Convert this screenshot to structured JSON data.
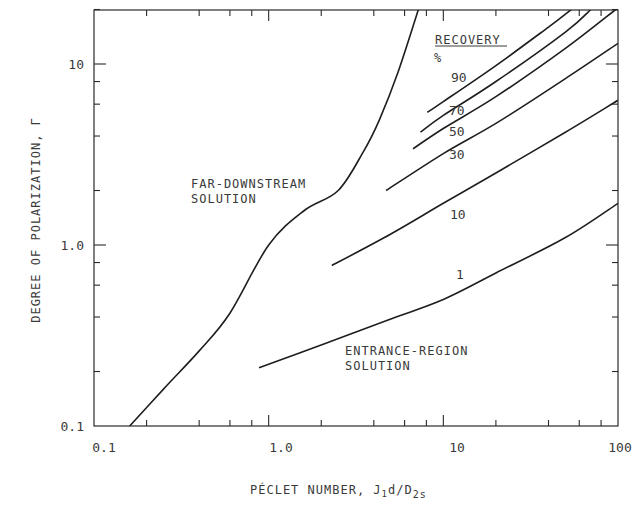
{
  "chart_data": {
    "type": "line",
    "title": "",
    "xlabel": "PÉCLET NUMBER, J1d/D2s",
    "xlabel_parts": {
      "main": "PÉCLET NUMBER, J",
      "sub1": "1",
      "mid": "d/D",
      "sub2": "2s"
    },
    "ylabel": "DEGREE OF POLARIZATION, Γ",
    "xscale": "log",
    "yscale": "log",
    "xlim": [
      0.1,
      100
    ],
    "ylim": [
      0.1,
      20
    ],
    "x_tick_labels": [
      "0.1",
      "1.0",
      "10",
      "100"
    ],
    "y_tick_labels": [
      "0.1",
      "1.0",
      "10"
    ],
    "grid": false,
    "legend": {
      "title": "RECOVERY",
      "unit": "%",
      "position": "upper right, inline labels"
    },
    "annotations": [
      {
        "text": "FAR-DOWNSTREAM",
        "line2": "SOLUTION"
      },
      {
        "text": "ENTRANCE-REGION",
        "line2": "SOLUTION"
      }
    ],
    "series": [
      {
        "name": "FAR-DOWNSTREAM SOLUTION",
        "label": "",
        "x": [
          0.16,
          0.25,
          0.4,
          0.6,
          1.0,
          1.6,
          2.5,
          3.5,
          4.3,
          5.5,
          7.2
        ],
        "y": [
          0.1,
          0.16,
          0.26,
          0.42,
          1.0,
          1.55,
          2.0,
          3.3,
          4.9,
          9.0,
          20
        ]
      },
      {
        "name": "1",
        "label": "1",
        "x": [
          0.88,
          2.0,
          5.0,
          10,
          20,
          50,
          100
        ],
        "y": [
          0.21,
          0.28,
          0.39,
          0.5,
          0.7,
          1.1,
          1.7
        ]
      },
      {
        "name": "10",
        "label": "10",
        "x": [
          2.3,
          5.0,
          10,
          20,
          50,
          100
        ],
        "y": [
          0.77,
          1.15,
          1.7,
          2.5,
          4.2,
          6.3
        ]
      },
      {
        "name": "30",
        "label": "30",
        "x": [
          4.7,
          10,
          20,
          50,
          100
        ],
        "y": [
          2.0,
          3.2,
          4.7,
          8.3,
          13
        ]
      },
      {
        "name": "50",
        "label": "50",
        "x": [
          6.7,
          10,
          20,
          50,
          97
        ],
        "y": [
          3.4,
          4.4,
          6.6,
          12.2,
          20
        ]
      },
      {
        "name": "70",
        "label": "70",
        "x": [
          7.4,
          10,
          20,
          50,
          70
        ],
        "y": [
          4.2,
          5.2,
          8.0,
          15,
          20
        ]
      },
      {
        "name": "90",
        "label": "90",
        "x": [
          8.1,
          10,
          20,
          40,
          54
        ],
        "y": [
          5.4,
          6.2,
          9.8,
          16,
          20
        ]
      }
    ]
  },
  "labels": {
    "ylabel": "DEGREE OF POLARIZATION, Γ",
    "xlabel_main": "PÉCLET NUMBER, J",
    "xlabel_sub1": "1",
    "xlabel_mid": "d/D",
    "xlabel_sub2": "2s",
    "recovery_title": "RECOVERY",
    "recovery_unit": "%",
    "far_line1": "FAR-DOWNSTREAM",
    "far_line2": "SOLUTION",
    "entr_line1": "ENTRANCE-REGION",
    "entr_line2": "SOLUTION",
    "rec_90": "90",
    "rec_70": "70",
    "rec_50": "50",
    "rec_30": "30",
    "rec_10": "10",
    "rec_1": "1",
    "xt0": "0.1",
    "xt1": "1.0",
    "xt2": "10",
    "xt3": "100",
    "yt0": "0.1",
    "yt1": "1.0",
    "yt2": "10"
  }
}
